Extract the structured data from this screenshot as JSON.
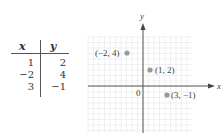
{
  "table": {
    "headers": [
      "x",
      "y"
    ],
    "rows": [
      {
        "x": "1",
        "y": "2"
      },
      {
        "x": "−2",
        "y": "4"
      },
      {
        "x": "3",
        "y": "−1"
      }
    ]
  },
  "graph": {
    "x_axis_label": "x",
    "y_axis_label": "y",
    "origin_label": "0",
    "point_color": "#999999",
    "grid_color": "#e6e6e6",
    "points": [
      {
        "x": -2,
        "y": 4,
        "label": "(−2, 4)"
      },
      {
        "x": 1,
        "y": 2,
        "label": "(1, 2)"
      },
      {
        "x": 3,
        "y": -1,
        "label": "(3, −1)"
      }
    ]
  },
  "chart_data": {
    "type": "scatter",
    "title": "",
    "xlabel": "x",
    "ylabel": "y",
    "grid": true,
    "points": [
      [
        -2,
        4
      ],
      [
        1,
        2
      ],
      [
        3,
        -1
      ]
    ],
    "point_labels": [
      "(−2, 4)",
      "(1, 2)",
      "(3, −1)"
    ],
    "table": {
      "headers": [
        "x",
        "y"
      ],
      "rows": [
        [
          1,
          2
        ],
        [
          -2,
          4
        ],
        [
          3,
          -1
        ]
      ]
    }
  }
}
